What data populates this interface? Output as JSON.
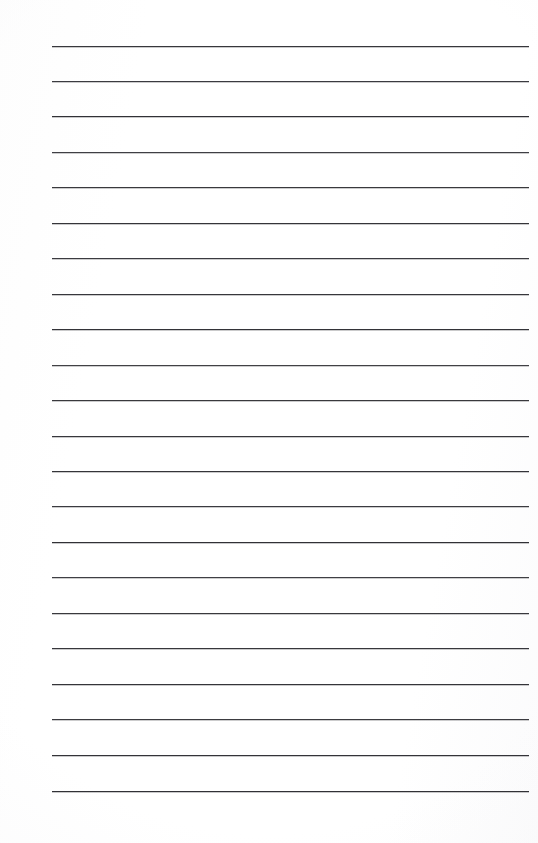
{
  "document": {
    "type": "lined-paper",
    "title": "Blank Ruled Notepad Page",
    "page_width": 538,
    "page_height": 843,
    "background_color": "#fefefe",
    "text_content": "",
    "notes": "Empty ruled writing sheet; no text, headings, numbers or marks are present in the pixels."
  },
  "ruling": {
    "line_count": 22,
    "line_color": "#26262a",
    "line_thickness_px": 1.7,
    "left_margin_px": 52,
    "right_margin_px": 529,
    "line_length_px": 477,
    "first_line_y_px": 46,
    "last_line_y_px": 791,
    "line_spacing_px": 35.5,
    "lines": [
      {
        "index": 1,
        "y": 46,
        "x1": 52,
        "x2": 529,
        "thickness": 1.8,
        "opacity": 0.97
      },
      {
        "index": 2,
        "y": 81,
        "x1": 52,
        "x2": 529,
        "thickness": 1.7,
        "opacity": 0.95
      },
      {
        "index": 3,
        "y": 116,
        "x1": 52,
        "x2": 529,
        "thickness": 1.9,
        "opacity": 1.0
      },
      {
        "index": 4,
        "y": 152,
        "x1": 52,
        "x2": 529,
        "thickness": 1.6,
        "opacity": 0.93
      },
      {
        "index": 5,
        "y": 187,
        "x1": 52,
        "x2": 529,
        "thickness": 1.8,
        "opacity": 0.96
      },
      {
        "index": 6,
        "y": 223,
        "x1": 52,
        "x2": 529,
        "thickness": 1.7,
        "opacity": 0.98
      },
      {
        "index": 7,
        "y": 258,
        "x1": 52,
        "x2": 529,
        "thickness": 1.8,
        "opacity": 0.95
      },
      {
        "index": 8,
        "y": 294,
        "x1": 52,
        "x2": 529,
        "thickness": 1.7,
        "opacity": 0.97
      },
      {
        "index": 9,
        "y": 329,
        "x1": 52,
        "x2": 529,
        "thickness": 1.9,
        "opacity": 0.99
      },
      {
        "index": 10,
        "y": 365,
        "x1": 52,
        "x2": 529,
        "thickness": 1.6,
        "opacity": 0.92
      },
      {
        "index": 11,
        "y": 400,
        "x1": 52,
        "x2": 529,
        "thickness": 1.8,
        "opacity": 0.96
      },
      {
        "index": 12,
        "y": 436,
        "x1": 52,
        "x2": 529,
        "thickness": 1.7,
        "opacity": 0.97
      },
      {
        "index": 13,
        "y": 471,
        "x1": 52,
        "x2": 529,
        "thickness": 1.8,
        "opacity": 0.98
      },
      {
        "index": 14,
        "y": 506,
        "x1": 52,
        "x2": 529,
        "thickness": 1.7,
        "opacity": 0.95
      },
      {
        "index": 15,
        "y": 542,
        "x1": 52,
        "x2": 529,
        "thickness": 1.9,
        "opacity": 1.0
      },
      {
        "index": 16,
        "y": 577,
        "x1": 52,
        "x2": 529,
        "thickness": 1.6,
        "opacity": 0.93
      },
      {
        "index": 17,
        "y": 613,
        "x1": 52,
        "x2": 529,
        "thickness": 1.8,
        "opacity": 0.96
      },
      {
        "index": 18,
        "y": 648,
        "x1": 52,
        "x2": 529,
        "thickness": 1.7,
        "opacity": 0.97
      },
      {
        "index": 19,
        "y": 684,
        "x1": 52,
        "x2": 529,
        "thickness": 1.8,
        "opacity": 0.98
      },
      {
        "index": 20,
        "y": 719,
        "x1": 52,
        "x2": 529,
        "thickness": 1.7,
        "opacity": 0.95
      },
      {
        "index": 21,
        "y": 755,
        "x1": 52,
        "x2": 529,
        "thickness": 1.9,
        "opacity": 0.99
      },
      {
        "index": 22,
        "y": 791,
        "x1": 52,
        "x2": 529,
        "thickness": 1.8,
        "opacity": 1.0
      }
    ]
  }
}
